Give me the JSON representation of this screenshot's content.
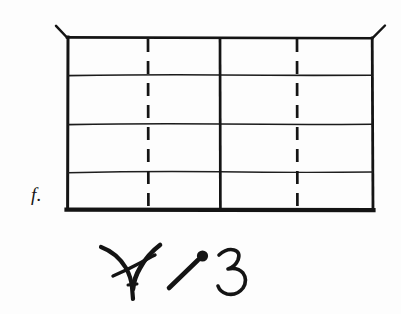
{
  "page": {
    "kind": "scanned-diagram",
    "background_color": "#fdfdfd",
    "ink_color": "#141414",
    "width": 401,
    "height": 314
  },
  "figure": {
    "name": "gridded-rectangle-diagram",
    "label": "f.",
    "frame": {
      "left": 67,
      "top": 37,
      "right": 373,
      "bottom": 210,
      "border_color": "#141414",
      "border_width_top": 2.6,
      "border_width_left": 3.0,
      "border_width_right": 2.6,
      "border_width_bottom": 4.2
    },
    "corner_ticks": [
      {
        "name": "top-left-tick",
        "x1": 67,
        "y1": 37,
        "x2": 56,
        "y2": 26
      },
      {
        "name": "top-right-tick",
        "x1": 372,
        "y1": 38,
        "x2": 385,
        "y2": 26
      }
    ],
    "horizontal_rules": [
      {
        "name": "horizontal-rule-1",
        "y": 75,
        "style": "solid",
        "width": 1.5
      },
      {
        "name": "horizontal-rule-2",
        "y": 124,
        "style": "solid",
        "width": 1.5
      },
      {
        "name": "horizontal-rule-3",
        "y": 172,
        "style": "solid",
        "width": 1.3
      }
    ],
    "vertical_rules": [
      {
        "name": "vertical-dashed-left",
        "x": 148,
        "style": "dashed",
        "width": 2.6,
        "dash": "13 9"
      },
      {
        "name": "vertical-solid-center",
        "x": 220,
        "style": "solid",
        "width": 2.6
      },
      {
        "name": "vertical-dashed-right",
        "x": 297,
        "style": "dashed",
        "width": 2.6,
        "dash": "13 9"
      }
    ]
  },
  "annotation": {
    "name": "handwritten-marks",
    "description": "handwritten marks beneath the figure",
    "marks": [
      {
        "name": "y-glyph",
        "text": "Y"
      },
      {
        "name": "stroke-with-dot-glyph",
        "text": "/"
      },
      {
        "name": "numeral-glyph",
        "text": "3"
      }
    ]
  }
}
